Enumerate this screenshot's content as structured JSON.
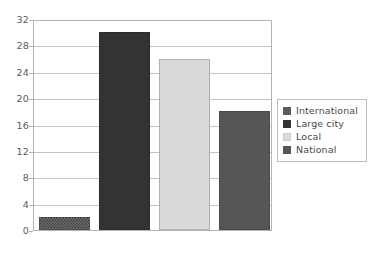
{
  "chart_data": {
    "type": "bar",
    "title": "",
    "subtitle": "",
    "xlabel": "",
    "ylabel": "",
    "categories": [
      "International",
      "Large city",
      "Local",
      "National"
    ],
    "values": [
      2,
      30,
      26,
      18
    ],
    "series": [
      {
        "name": "",
        "values": [
          2,
          30,
          26,
          18
        ]
      }
    ],
    "ylim": [
      0,
      32
    ],
    "y_ticks": [
      0,
      4,
      8,
      12,
      16,
      20,
      24,
      28,
      32
    ],
    "y_tick_labels": [
      "0",
      "4",
      "8",
      "12",
      "16",
      "20",
      "24",
      "28",
      "32"
    ],
    "x_tick_labels": [
      "",
      "",
      "",
      ""
    ],
    "grid": "horizontal",
    "legend_position": "right",
    "legend_entries": [
      {
        "label": "International",
        "color": "#6e6e6e",
        "pattern": "checkerboard"
      },
      {
        "label": "Large city",
        "color": "#333333",
        "pattern": "solid"
      },
      {
        "label": "Local",
        "color": "#d9d9d9",
        "pattern": "solid"
      },
      {
        "label": "National",
        "color": "#565656",
        "pattern": "solid"
      }
    ],
    "annotations": [],
    "colors": {
      "plot_border": "#b4b4b4",
      "gridline": "#c4c4c4",
      "background": "#ffffff",
      "text": "#4a4a4a",
      "legend_border": "#bdbdbd"
    }
  }
}
